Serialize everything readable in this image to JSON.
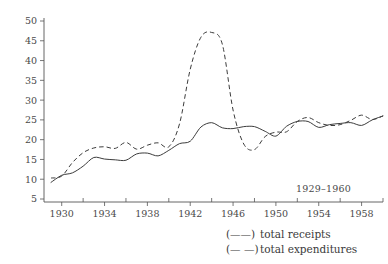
{
  "chart_data": {
    "type": "line",
    "title": "",
    "subtitle": "",
    "xlabel": "",
    "ylabel": "",
    "range_note": "1929–1960",
    "xlim": [
      1929,
      1960
    ],
    "ylim": [
      5,
      50
    ],
    "grid": false,
    "legend_position": "bottom-right",
    "x_ticks": [
      1930,
      1934,
      1938,
      1942,
      1946,
      1950,
      1954,
      1958
    ],
    "x_tick_labels": [
      "1930",
      "1934",
      "1938",
      "1942",
      "1946",
      "1950",
      "1954",
      "1958"
    ],
    "x_minor_ticks": [
      1932,
      1936,
      1940,
      1944,
      1948,
      1952,
      1956,
      1960
    ],
    "y_ticks": [
      5,
      10,
      15,
      20,
      25,
      30,
      35,
      40,
      45,
      50
    ],
    "y_tick_labels": [
      "5",
      "10",
      "15",
      "20",
      "25",
      "30",
      "35",
      "40",
      "45",
      "50"
    ],
    "x": [
      1929,
      1930,
      1931,
      1932,
      1933,
      1934,
      1935,
      1936,
      1937,
      1938,
      1939,
      1940,
      1941,
      1942,
      1943,
      1944,
      1945,
      1946,
      1947,
      1948,
      1949,
      1950,
      1951,
      1952,
      1953,
      1954,
      1955,
      1956,
      1957,
      1958,
      1959,
      1960
    ],
    "series": [
      {
        "name": "total receipts",
        "style": "solid",
        "color": "#3c3c3c",
        "values": [
          9.2,
          11.0,
          11.6,
          13.3,
          15.5,
          15.1,
          14.9,
          14.8,
          16.4,
          16.6,
          15.9,
          17.3,
          19.0,
          19.6,
          23.2,
          24.3,
          23.0,
          22.8,
          23.3,
          23.3,
          22.1,
          20.9,
          23.4,
          24.6,
          24.6,
          23.1,
          23.8,
          24.1,
          24.3,
          23.6,
          25.0,
          26.0
        ]
      },
      {
        "name": "total expenditures",
        "style": "dashed",
        "color": "#3c3c3c",
        "values": [
          10.3,
          10.8,
          14.2,
          16.7,
          17.9,
          18.2,
          17.8,
          19.3,
          17.6,
          18.6,
          19.2,
          18.2,
          24.0,
          37.8,
          45.9,
          47.1,
          44.1,
          27.5,
          18.9,
          17.5,
          20.8,
          21.9,
          22.0,
          24.6,
          25.6,
          24.3,
          23.6,
          23.8,
          24.9,
          26.2,
          25.1,
          26.0
        ]
      }
    ],
    "legend": [
      {
        "key": "(——)",
        "label": "total receipts"
      },
      {
        "key": "(— —)",
        "label": "total expenditures"
      }
    ]
  }
}
